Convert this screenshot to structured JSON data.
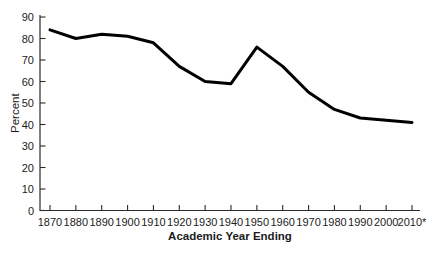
{
  "chart_data": {
    "type": "line",
    "title": "",
    "xlabel": "Academic Year Ending",
    "ylabel": "Percent",
    "categories": [
      "1870",
      "1880",
      "1890",
      "1900",
      "1910",
      "1920",
      "1930",
      "1940",
      "1950",
      "1960",
      "1970",
      "1980",
      "1990",
      "2000",
      "2010*"
    ],
    "values": [
      84,
      80,
      82,
      81,
      78,
      67,
      60,
      59,
      76,
      67,
      55,
      47,
      43,
      42,
      41
    ],
    "ylim": [
      0,
      90
    ],
    "ytick_step": 10,
    "grid": false,
    "legend": "none",
    "line_color": "#000000",
    "axis_color": "#2b2b2b",
    "text_color": "#1c1c1c",
    "line_width": 3
  }
}
